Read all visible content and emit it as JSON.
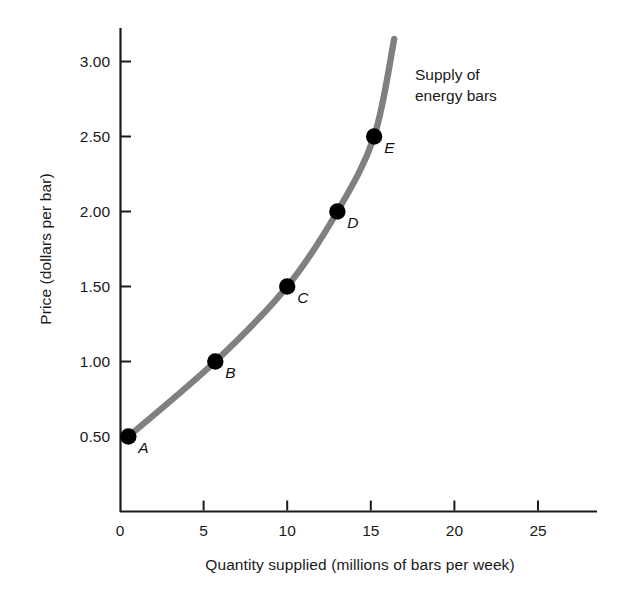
{
  "figure": {
    "background_color": "#ffffff",
    "axis_color": "#1a1a1a",
    "curve_color": "#808080",
    "point_color": "#000000"
  },
  "chart_data": {
    "type": "line",
    "title": "",
    "subtitle": "",
    "xlabel": "Quantity supplied (millions of bars per week)",
    "ylabel": "Price (dollars per bar)",
    "xlim": [
      0,
      28.5
    ],
    "ylim": [
      0,
      3.4
    ],
    "xticks": [
      0,
      5,
      10,
      15,
      20,
      25
    ],
    "xtick_labels": [
      "0",
      "5",
      "10",
      "15",
      "20",
      "25"
    ],
    "yticks": [
      0.5,
      1.0,
      1.5,
      2.0,
      2.5,
      3.0
    ],
    "ytick_labels": [
      "0.50",
      "1.00",
      "1.50",
      "2.00",
      "2.50",
      "3.00"
    ],
    "grid": false,
    "legend": null,
    "annotations": [
      {
        "name": "supply-curve-annotation",
        "text": "Supply of\nenergy bars",
        "x": 17.7,
        "y": 3.0
      }
    ],
    "series": [
      {
        "name": "Supply of energy bars",
        "color": "#808080",
        "x": [
          0.5,
          5.7,
          10.0,
          13.0,
          15.2,
          16.4
        ],
        "y": [
          0.5,
          1.0,
          1.5,
          2.0,
          2.5,
          3.15
        ],
        "marked_points": [
          {
            "label": "A",
            "x": 0.5,
            "y": 0.5
          },
          {
            "label": "B",
            "x": 5.7,
            "y": 1.0
          },
          {
            "label": "C",
            "x": 10.0,
            "y": 1.5
          },
          {
            "label": "D",
            "x": 13.0,
            "y": 2.0
          },
          {
            "label": "E",
            "x": 15.2,
            "y": 2.5
          }
        ]
      }
    ]
  }
}
